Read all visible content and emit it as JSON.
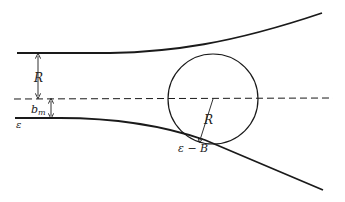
{
  "diagram": {
    "type": "geometry",
    "labels": {
      "upper_gap": "R",
      "lower_gap_base": "b",
      "lower_gap_sub": "m",
      "epsilon": "ε",
      "circle_radius": "R",
      "tangent_point": "ε − B"
    },
    "elements": {
      "upper_curve": "upper boundary curving upward to the right",
      "lower_curve": "lower boundary curving downward to the right",
      "axis": "horizontal dashed center line",
      "circle": "circle of radius R centered on dashed axis, tangent to lower curve"
    },
    "colors": {
      "stroke": "#1a1a1a",
      "background": "#ffffff"
    }
  }
}
